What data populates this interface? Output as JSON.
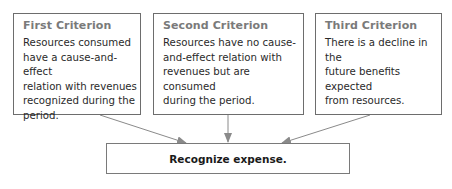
{
  "criteria": [
    {
      "title": "First Criterion",
      "lines": [
        "Resources consumed",
        "have a cause-and-effect",
        "relation with revenues",
        "recognized during the",
        "period."
      ]
    },
    {
      "title": "Second Criterion",
      "lines": [
        "Resources have no cause-",
        "and-effect relation with",
        "revenues but are consumed",
        "during the period."
      ]
    },
    {
      "title": "Third Criterion",
      "lines": [
        "There is a decline in the",
        "future benefits expected",
        "from resources."
      ]
    }
  ],
  "result": {
    "label": "Recognize expense."
  },
  "colors": {
    "border": "#6d6d6d",
    "arrow": "#8a8a8a",
    "title": "#7a7a7a"
  }
}
